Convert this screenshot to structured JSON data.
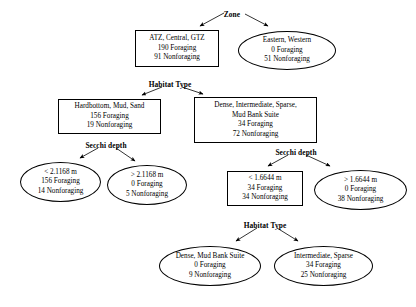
{
  "diagram": {
    "type": "decision-tree",
    "colors": {
      "background": "#ffffff",
      "stroke": "#000000",
      "text": "#000000"
    },
    "split_labels": [
      {
        "id": "split-zone",
        "text": "Zone",
        "x": 232,
        "y": 14
      },
      {
        "id": "split-habitat-type-top",
        "text": "Habitat Type",
        "x": 170,
        "y": 84
      },
      {
        "id": "split-secchi-depth-left",
        "text": "Secchi depth",
        "x": 106,
        "y": 145
      },
      {
        "id": "split-secchi-depth-right",
        "text": "Secchi depth",
        "x": 296,
        "y": 152
      },
      {
        "id": "split-habitat-type-bottom",
        "text": "Habitat Type",
        "x": 265,
        "y": 225
      }
    ],
    "nodes": [
      {
        "id": "node-atz-central-gtz",
        "shape": "box",
        "x": 135,
        "y": 30,
        "w": 84,
        "h": 37,
        "lines": [
          "ATZ, Central, GTZ",
          "190 Foraging",
          "91 Nonforaging"
        ]
      },
      {
        "id": "node-eastern-western",
        "shape": "ellipse",
        "x": 238,
        "y": 31,
        "w": 98,
        "h": 39,
        "lines": [
          "Eastern, Western",
          "0 Foraging",
          "51 Nonforaging"
        ]
      },
      {
        "id": "node-hardbottom-mud-sand",
        "shape": "box",
        "x": 58,
        "y": 99,
        "w": 103,
        "h": 35,
        "lines": [
          "Hardbottom, Mud, Sand",
          "156 Foraging",
          "19 Nonforaging"
        ]
      },
      {
        "id": "node-dense-intermediate-sparse-mud-bank-suite",
        "shape": "box",
        "x": 194,
        "y": 97,
        "w": 123,
        "h": 46,
        "lines": [
          "Dense, Intermediate, Sparse,",
          "Mud Bank Suite",
          "34 Foraging",
          "72 Nonforaging"
        ]
      },
      {
        "id": "node-secchi-lt-2-1168",
        "shape": "ellipse",
        "x": 20,
        "y": 162,
        "w": 81,
        "h": 40,
        "lines": [
          "< 2.1168 m",
          "156 Foraging",
          "14 Nonforaging"
        ]
      },
      {
        "id": "node-secchi-gt-2-1168",
        "shape": "ellipse",
        "x": 107,
        "y": 165,
        "w": 80,
        "h": 40,
        "lines": [
          "> 2.1168 m",
          "0 Foraging",
          "5 Nonforaging"
        ]
      },
      {
        "id": "node-secchi-lt-1-6644",
        "shape": "box",
        "x": 227,
        "y": 171,
        "w": 76,
        "h": 35,
        "lines": [
          "< 1.6644 m",
          "34 Foraging",
          "34 Nonforaging"
        ]
      },
      {
        "id": "node-secchi-gt-1-6644",
        "shape": "ellipse",
        "x": 314,
        "y": 170,
        "w": 93,
        "h": 40,
        "lines": [
          "> 1.6644 m",
          "0 Foraging",
          "38 Nonforaging"
        ]
      },
      {
        "id": "node-dense-mud-bank-suite",
        "shape": "ellipse",
        "x": 159,
        "y": 246,
        "w": 102,
        "h": 40,
        "lines": [
          "Dense, Mud Bank Suite",
          "0 Foraging",
          "9 Nonforaging"
        ]
      },
      {
        "id": "node-intermediate-sparse",
        "shape": "ellipse",
        "x": 274,
        "y": 246,
        "w": 99,
        "h": 40,
        "lines": [
          "Intermediate, Sparse",
          "34 Foraging",
          "25 Nonforaging"
        ]
      }
    ],
    "edges": [
      {
        "id": "edge-zone-left",
        "x1": 224,
        "y1": 13,
        "x2": 200,
        "y2": 26
      },
      {
        "id": "edge-zone-right",
        "x1": 245,
        "y1": 14,
        "x2": 268,
        "y2": 26
      },
      {
        "id": "edge-habitat-top-left",
        "x1": 162,
        "y1": 87,
        "x2": 142,
        "y2": 95
      },
      {
        "id": "edge-habitat-top-right",
        "x1": 182,
        "y1": 87,
        "x2": 203,
        "y2": 94
      },
      {
        "id": "edge-secchi-left-left",
        "x1": 98,
        "y1": 148,
        "x2": 80,
        "y2": 158
      },
      {
        "id": "edge-secchi-left-right",
        "x1": 116,
        "y1": 148,
        "x2": 135,
        "y2": 161
      },
      {
        "id": "edge-secchi-right-left",
        "x1": 288,
        "y1": 155,
        "x2": 268,
        "y2": 166
      },
      {
        "id": "edge-secchi-right-right",
        "x1": 306,
        "y1": 155,
        "x2": 330,
        "y2": 166
      },
      {
        "id": "edge-habitat-bottom-left",
        "x1": 257,
        "y1": 228,
        "x2": 236,
        "y2": 241
      },
      {
        "id": "edge-habitat-bottom-right",
        "x1": 277,
        "y1": 228,
        "x2": 298,
        "y2": 241
      }
    ]
  }
}
